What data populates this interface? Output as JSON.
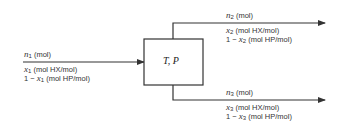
{
  "unit": {
    "label": "T, P"
  },
  "streams": {
    "feed": {
      "flow_var": "n",
      "flow_sub": "1",
      "flow_unit": " (mol)",
      "frac_var": "x",
      "frac_sub": "1",
      "frac_unit": " (mol HX/mol)",
      "comp_prefix": "1 − ",
      "comp_var": "x",
      "comp_sub": "1",
      "comp_unit": " (mol HP/mol)"
    },
    "top": {
      "flow_var": "n",
      "flow_sub": "2",
      "flow_unit": " (mol)",
      "frac_var": "x",
      "frac_sub": "2",
      "frac_unit": " (mol HX/mol)",
      "comp_prefix": "1 − ",
      "comp_var": "x",
      "comp_sub": "2",
      "comp_unit": " (mol HP/mol)"
    },
    "bottom": {
      "flow_var": "n",
      "flow_sub": "3",
      "flow_unit": " (mol)",
      "frac_var": "x",
      "frac_sub": "3",
      "frac_unit": " (mol HX/mol)",
      "comp_prefix": "1 − ",
      "comp_var": "x",
      "comp_sub": "3",
      "comp_unit": " (mol HP/mol)"
    }
  },
  "colors": {
    "line": "#333333",
    "text": "#333333"
  }
}
